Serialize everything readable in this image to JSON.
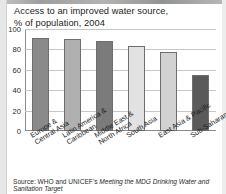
{
  "title": {
    "line1": "Access to an improved water source,",
    "line2": "% of population, 2004"
  },
  "source": {
    "lead": "Source: WHO and UNICEF's ",
    "italic": "Meeting the MDG Drinking Water and Sanitation Target"
  },
  "chart_data": {
    "type": "bar",
    "title": "Access to an improved water source, % of population, 2004",
    "xlabel": "",
    "ylabel": "% of population",
    "ylim": [
      0,
      100
    ],
    "yticks": [
      0,
      20,
      40,
      60,
      80,
      100
    ],
    "ytick_labels": [
      "0",
      "20",
      "40",
      "60",
      "80",
      "100"
    ],
    "grid": true,
    "legend": "none",
    "categories": [
      "Europe & Central Asia",
      "Latin America & Caribbean",
      "Middle East & North Africa",
      "South Asia",
      "East Asia & Pacific",
      "Sub-Saharan Africa"
    ],
    "category_lines": [
      [
        "Europe &",
        "Central Asia"
      ],
      [
        "Latin America &",
        "Caribbean"
      ],
      [
        "Middle East &",
        "North Africa"
      ],
      [
        "South Asia"
      ],
      [
        "East Asia & Pacific"
      ],
      [
        "Sub-Saharan Africa"
      ]
    ],
    "values": [
      91,
      90,
      88,
      83,
      77,
      55
    ],
    "bar_colors": [
      "#8a8a8a",
      "#b0b0b0",
      "#7b7b7b",
      "#e2e2e2",
      "#d2d2d2",
      "#5a5a5a"
    ]
  }
}
